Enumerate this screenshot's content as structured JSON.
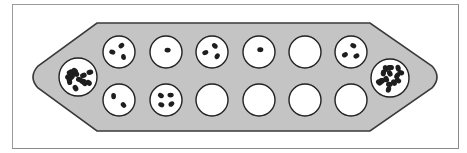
{
  "game": {
    "name": "Mancala board",
    "colors": {
      "board_fill": "#c4c4c4",
      "board_stroke": "#3a3a3a",
      "pit_fill": "#ffffff",
      "pit_stroke": "#222222",
      "seed": "#1e1e1e",
      "frame": "#8a8a8a"
    },
    "stores": [
      {
        "id": "left-store",
        "cx": 78,
        "cy": 77,
        "r": 19,
        "seeds": 16
      },
      {
        "id": "right-store",
        "cx": 390,
        "cy": 78,
        "r": 19,
        "seeds": 16
      }
    ],
    "top_row": [
      {
        "cx": 119,
        "cy": 52,
        "seeds": 3
      },
      {
        "cx": 166,
        "cy": 52,
        "seeds": 1
      },
      {
        "cx": 212,
        "cy": 52,
        "seeds": 3
      },
      {
        "cx": 259,
        "cy": 52,
        "seeds": 1
      },
      {
        "cx": 305,
        "cy": 52,
        "seeds": 0
      },
      {
        "cx": 351,
        "cy": 52,
        "seeds": 3
      }
    ],
    "bottom_row": [
      {
        "cx": 119,
        "cy": 100,
        "seeds": 2
      },
      {
        "cx": 166,
        "cy": 100,
        "seeds": 4
      },
      {
        "cx": 212,
        "cy": 100,
        "seeds": 0
      },
      {
        "cx": 259,
        "cy": 100,
        "seeds": 0
      },
      {
        "cx": 305,
        "cy": 100,
        "seeds": 0
      },
      {
        "cx": 351,
        "cy": 100,
        "seeds": 0
      }
    ],
    "pit_radius": 16
  }
}
